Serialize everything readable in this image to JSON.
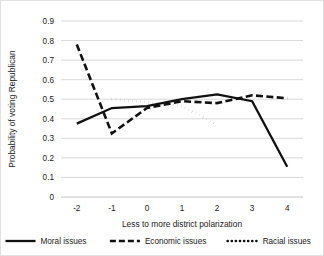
{
  "chart_data": {
    "type": "line",
    "title": "",
    "xlabel": "Less to more district polarization",
    "ylabel": "Probability of voting Republican",
    "x": [
      -2,
      -1,
      0,
      1,
      2,
      3,
      4
    ],
    "xtick_labels": [
      "-2",
      "-1",
      "0",
      "1",
      "2",
      "3",
      "4"
    ],
    "ytick_labels": [
      "0",
      "0.1",
      "0.2",
      "0.3",
      "0.4",
      "0.5",
      "0.6",
      "0.7",
      "0.8",
      "0.9"
    ],
    "ytick_values": [
      0,
      0.1,
      0.2,
      0.3,
      0.4,
      0.5,
      0.6,
      0.7,
      0.8,
      0.9
    ],
    "xlim": [
      -2.45,
      4.45
    ],
    "ylim": [
      0,
      0.9
    ],
    "grid": true,
    "legend_position": "bottom",
    "series": [
      {
        "name": "Moral issues",
        "style": "solid",
        "color": "#111111",
        "x": [
          -2,
          -1,
          0,
          1,
          2,
          3,
          4
        ],
        "values": [
          0.375,
          0.455,
          0.465,
          0.5,
          0.525,
          0.49,
          0.155
        ]
      },
      {
        "name": "Economic issues",
        "style": "dashed",
        "color": "#111111",
        "x": [
          -2,
          -1,
          0,
          1,
          2,
          3,
          4
        ],
        "values": [
          0.78,
          0.325,
          0.455,
          0.49,
          0.48,
          0.52,
          0.505
        ]
      },
      {
        "name": "Racial issues",
        "style": "dotted",
        "color": "#111111",
        "x": [
          -1,
          0,
          1,
          2
        ],
        "values": [
          0.5,
          0.485,
          0.465,
          0.37
        ]
      }
    ]
  },
  "legend": {
    "items": [
      {
        "label": "Moral issues",
        "style": "solid"
      },
      {
        "label": "Economic issues",
        "style": "dashed"
      },
      {
        "label": "Racial issues",
        "style": "dotted"
      }
    ]
  }
}
